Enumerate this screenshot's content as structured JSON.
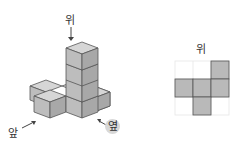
{
  "iso_view": {
    "labels": {
      "top": "위",
      "front": "앞",
      "side": "옆"
    }
  },
  "top_view": {
    "title": "위",
    "grid": {
      "rows": 3,
      "cols": 3
    },
    "filled_cells": [
      [
        0,
        2
      ],
      [
        1,
        0
      ],
      [
        1,
        1
      ],
      [
        1,
        2
      ],
      [
        2,
        1
      ]
    ]
  },
  "colors": {
    "cube_top": "#d6d6d6",
    "cube_left": "#bdbdbd",
    "cube_right": "#a8a8a8",
    "edge": "#555555",
    "cell_fill": "#b9b9b9",
    "grid_line": "#e6e6e6"
  }
}
